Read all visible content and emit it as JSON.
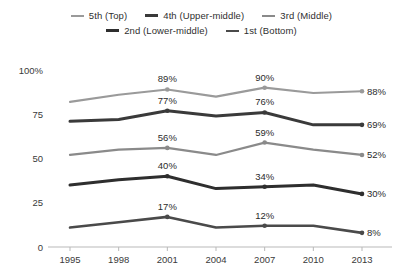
{
  "legend": {
    "rows": [
      [
        {
          "label": "5th (Top)",
          "color": "#9a9a9a",
          "width": 2.2
        },
        {
          "label": "4th (Upper-middle)",
          "color": "#3a3a3a",
          "width": 3.0
        },
        {
          "label": "3rd (Middle)",
          "color": "#8a8a8a",
          "width": 2.2
        }
      ],
      [
        {
          "label": "2nd (Lower-middle)",
          "color": "#2e2e2e",
          "width": 3.0
        },
        {
          "label": "1st (Bottom)",
          "color": "#4a4a4a",
          "width": 2.6
        }
      ]
    ]
  },
  "axes": {
    "y_ticks": [
      "100%",
      "75",
      "50",
      "25",
      "0"
    ],
    "y_values": [
      100,
      75,
      50,
      25,
      0
    ],
    "x_ticks": [
      "1995",
      "1998",
      "2001",
      "2004",
      "2007",
      "2010",
      "2013"
    ]
  },
  "chart_data": {
    "type": "line",
    "title": "",
    "subtitle": "",
    "xlabel": "",
    "ylabel": "",
    "ylim": [
      0,
      100
    ],
    "grid": false,
    "legend_position": "top",
    "x": [
      1995,
      1998,
      2001,
      2004,
      2007,
      2010,
      2013
    ],
    "series": [
      {
        "name": "5th (Top)",
        "color": "#9a9a9a",
        "stroke_width": 2.2,
        "values": [
          82,
          86,
          89,
          85,
          90,
          87,
          88
        ],
        "labels": {
          "2001": "89%",
          "2007": "90%",
          "2013": "88%"
        }
      },
      {
        "name": "4th (Upper-middle)",
        "color": "#3a3a3a",
        "stroke_width": 3.0,
        "values": [
          71,
          72,
          77,
          74,
          76,
          69,
          69
        ],
        "labels": {
          "2001": "77%",
          "2007": "76%",
          "2013": "69%"
        }
      },
      {
        "name": "3rd (Middle)",
        "color": "#8a8a8a",
        "stroke_width": 2.2,
        "values": [
          52,
          55,
          56,
          52,
          59,
          55,
          52
        ],
        "labels": {
          "2001": "56%",
          "2007": "59%",
          "2013": "52%"
        }
      },
      {
        "name": "2nd (Lower-middle)",
        "color": "#2e2e2e",
        "stroke_width": 3.0,
        "values": [
          35,
          38,
          40,
          33,
          34,
          35,
          30
        ],
        "labels": {
          "2001": "40%",
          "2007": "34%",
          "2013": "30%"
        }
      },
      {
        "name": "1st (Bottom)",
        "color": "#4a4a4a",
        "stroke_width": 2.6,
        "values": [
          11,
          14,
          17,
          11,
          12,
          12,
          8
        ],
        "labels": {
          "2001": "17%",
          "2007": "12%",
          "2013": "8%"
        }
      }
    ],
    "annotations": [
      {
        "series": "5th (Top)",
        "x": 2001,
        "text": "89%"
      },
      {
        "series": "5th (Top)",
        "x": 2007,
        "text": "90%"
      },
      {
        "series": "5th (Top)",
        "x": 2013,
        "text": "88%"
      },
      {
        "series": "4th (Upper-middle)",
        "x": 2001,
        "text": "77%"
      },
      {
        "series": "4th (Upper-middle)",
        "x": 2007,
        "text": "76%"
      },
      {
        "series": "4th (Upper-middle)",
        "x": 2013,
        "text": "69%"
      },
      {
        "series": "3rd (Middle)",
        "x": 2001,
        "text": "56%"
      },
      {
        "series": "3rd (Middle)",
        "x": 2007,
        "text": "59%"
      },
      {
        "series": "3rd (Middle)",
        "x": 2013,
        "text": "52%"
      },
      {
        "series": "2nd (Lower-middle)",
        "x": 2001,
        "text": "40%"
      },
      {
        "series": "2nd (Lower-middle)",
        "x": 2007,
        "text": "34%"
      },
      {
        "series": "2nd (Lower-middle)",
        "x": 2013,
        "text": "30%"
      },
      {
        "series": "1st (Bottom)",
        "x": 2001,
        "text": "17%"
      },
      {
        "series": "1st (Bottom)",
        "x": 2007,
        "text": "12%"
      },
      {
        "series": "1st (Bottom)",
        "x": 2013,
        "text": "8%"
      }
    ]
  }
}
